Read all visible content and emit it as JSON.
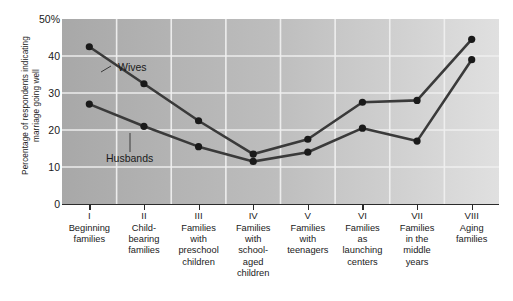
{
  "chart_data": {
    "type": "line",
    "title": "",
    "xlabel": "",
    "ylabel": "Percentage of respondents indicating marriage going well",
    "ylim": [
      0,
      50
    ],
    "yticks": [
      "0",
      "10",
      "20",
      "30",
      "40",
      "50%"
    ],
    "grid": true,
    "legend_position": "inline-annotation",
    "categories": [
      "Beginning families",
      "Child-bearing families",
      "Families with preschool children",
      "Families with school-aged children",
      "Families with teenagers",
      "Families as launching centers",
      "Families in the middle years",
      "Aging families"
    ],
    "category_numerals": [
      "I",
      "II",
      "III",
      "IV",
      "V",
      "VI",
      "VII",
      "VIII"
    ],
    "category_lines": [
      [
        "Beginning",
        "families"
      ],
      [
        "Child-",
        "bearing",
        "families"
      ],
      [
        "Families",
        "with",
        "preschool",
        "children"
      ],
      [
        "Families",
        "with",
        "school-",
        "aged",
        "children"
      ],
      [
        "Families",
        "with",
        "teenagers"
      ],
      [
        "Families",
        "as",
        "launching",
        "centers"
      ],
      [
        "Families",
        "in the",
        "middle",
        "years"
      ],
      [
        "Aging",
        "families"
      ]
    ],
    "series": [
      {
        "name": "Wives",
        "values": [
          42.5,
          32.5,
          22.5,
          13.5,
          17.5,
          27.5,
          28.0,
          44.5
        ]
      },
      {
        "name": "Husbands",
        "values": [
          27.0,
          21.0,
          15.5,
          11.5,
          14.0,
          20.5,
          17.0,
          39.0
        ]
      }
    ],
    "annotations": [
      {
        "text": "Wives",
        "series": "Wives"
      },
      {
        "text": "Husbands",
        "series": "Husbands"
      }
    ],
    "colors": {
      "line": "#3a3a3a",
      "marker": "#1a1a1a",
      "gridline": "#f0f0f0",
      "plot_background_left": "#a8a8a8",
      "plot_background_right": "#e0e0e0",
      "axis": "#2b2b2b",
      "text": "#1a1a1a"
    }
  },
  "axis": {
    "ylabel_line1": "Percentage of respondents indicating",
    "ylabel_line2": "marriage going well"
  }
}
